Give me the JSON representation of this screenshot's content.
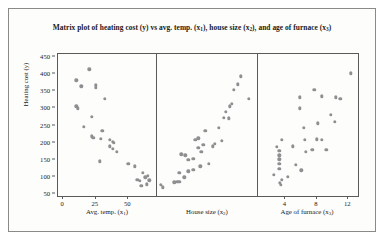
{
  "chart_data": {
    "type": "scatter",
    "title": "Matrix plot of heating cost (y) vs avg. temp. (x1), house size (x2), and age of furnace (x3)",
    "title_parts": {
      "seg1": "Matrix plot of heating cost (y) vs avg. temp. (x",
      "sub1": "1",
      "seg2": "), house size (x",
      "sub2": "2",
      "seg3": "), and age of furnace (x",
      "sub3": "3",
      "seg4": ")"
    },
    "ylabel": "Heating cost (y)",
    "ylabel_parts": {
      "text": "Heating cost (y)"
    },
    "ylim": [
      40,
      460
    ],
    "yticks": [
      50,
      100,
      150,
      200,
      250,
      300,
      350,
      400,
      450
    ],
    "grid": false,
    "legend": "none",
    "marker_color": "#8f8f91",
    "axis_color": "#5a5a5a",
    "panels": [
      {
        "name": "avg-temp",
        "xlabel_text": "Avg. temp. (x",
        "xlabel_sub": "1",
        "xlabel_tail": ")",
        "xlim": [
          -4,
          72
        ],
        "xticks": [
          0,
          25,
          50
        ],
        "xtick_labels": [
          "0",
          "25",
          "50"
        ],
        "relationship": "negative",
        "points": [
          {
            "x": 10,
            "y": 380
          },
          {
            "x": 14,
            "y": 362
          },
          {
            "x": 20,
            "y": 412
          },
          {
            "x": 10,
            "y": 303
          },
          {
            "x": 11,
            "y": 297
          },
          {
            "x": 25,
            "y": 365
          },
          {
            "x": 25,
            "y": 357
          },
          {
            "x": 22,
            "y": 272
          },
          {
            "x": 32,
            "y": 325
          },
          {
            "x": 16,
            "y": 243
          },
          {
            "x": 30,
            "y": 232
          },
          {
            "x": 22,
            "y": 215
          },
          {
            "x": 23,
            "y": 211
          },
          {
            "x": 29,
            "y": 208
          },
          {
            "x": 36,
            "y": 205
          },
          {
            "x": 38,
            "y": 200
          },
          {
            "x": 39,
            "y": 196
          },
          {
            "x": 36,
            "y": 186
          },
          {
            "x": 38,
            "y": 178
          },
          {
            "x": 41,
            "y": 170
          },
          {
            "x": 28,
            "y": 142
          },
          {
            "x": 50,
            "y": 134
          },
          {
            "x": 55,
            "y": 127
          },
          {
            "x": 61,
            "y": 108
          },
          {
            "x": 57,
            "y": 88
          },
          {
            "x": 59,
            "y": 84
          },
          {
            "x": 63,
            "y": 95
          },
          {
            "x": 65,
            "y": 100
          },
          {
            "x": 66,
            "y": 86
          },
          {
            "x": 60,
            "y": 70
          },
          {
            "x": 64,
            "y": 74
          }
        ]
      },
      {
        "name": "house-size",
        "xlabel_text": "House size (x",
        "xlabel_sub": "2",
        "xlabel_tail": ")",
        "xlim": [
          0,
          100
        ],
        "xticks": [],
        "xtick_labels": [],
        "relationship": "positive",
        "points": [
          {
            "x": 4,
            "y": 72
          },
          {
            "x": 6,
            "y": 66
          },
          {
            "x": 17,
            "y": 80
          },
          {
            "x": 20,
            "y": 82
          },
          {
            "x": 22,
            "y": 81
          },
          {
            "x": 27,
            "y": 95
          },
          {
            "x": 22,
            "y": 108
          },
          {
            "x": 31,
            "y": 113
          },
          {
            "x": 36,
            "y": 117
          },
          {
            "x": 43,
            "y": 127
          },
          {
            "x": 31,
            "y": 146
          },
          {
            "x": 36,
            "y": 149
          },
          {
            "x": 24,
            "y": 163
          },
          {
            "x": 28,
            "y": 160
          },
          {
            "x": 44,
            "y": 169
          },
          {
            "x": 51,
            "y": 135
          },
          {
            "x": 41,
            "y": 181
          },
          {
            "x": 46,
            "y": 190
          },
          {
            "x": 55,
            "y": 186
          },
          {
            "x": 57,
            "y": 193
          },
          {
            "x": 38,
            "y": 205
          },
          {
            "x": 41,
            "y": 210
          },
          {
            "x": 64,
            "y": 203
          },
          {
            "x": 48,
            "y": 232
          },
          {
            "x": 61,
            "y": 240
          },
          {
            "x": 66,
            "y": 270
          },
          {
            "x": 71,
            "y": 268
          },
          {
            "x": 68,
            "y": 288
          },
          {
            "x": 72,
            "y": 303
          },
          {
            "x": 74,
            "y": 310
          },
          {
            "x": 76,
            "y": 352
          },
          {
            "x": 80,
            "y": 368
          },
          {
            "x": 83,
            "y": 392
          },
          {
            "x": 91,
            "y": 325
          }
        ]
      },
      {
        "name": "age-of-furnace",
        "xlabel_text": "Age of furnace (x",
        "xlabel_sub": "3",
        "xlabel_tail": ")",
        "xlim": [
          0.5,
          13.5
        ],
        "xticks": [
          4,
          8,
          12
        ],
        "xtick_labels": [
          "4",
          "8",
          "12"
        ],
        "relationship": "weak positive",
        "points": [
          {
            "x": 3.3,
            "y": 78
          },
          {
            "x": 3.4,
            "y": 72
          },
          {
            "x": 3.5,
            "y": 88
          },
          {
            "x": 2.5,
            "y": 102
          },
          {
            "x": 4.3,
            "y": 96
          },
          {
            "x": 3.2,
            "y": 120
          },
          {
            "x": 3.2,
            "y": 134
          },
          {
            "x": 3.2,
            "y": 148
          },
          {
            "x": 3.2,
            "y": 160
          },
          {
            "x": 3.2,
            "y": 172
          },
          {
            "x": 2.9,
            "y": 185
          },
          {
            "x": 5.3,
            "y": 131
          },
          {
            "x": 6.0,
            "y": 115
          },
          {
            "x": 4.9,
            "y": 186
          },
          {
            "x": 6.6,
            "y": 170
          },
          {
            "x": 3.5,
            "y": 205
          },
          {
            "x": 6.5,
            "y": 205
          },
          {
            "x": 6.3,
            "y": 240
          },
          {
            "x": 7.4,
            "y": 175
          },
          {
            "x": 8.0,
            "y": 207
          },
          {
            "x": 8.6,
            "y": 205
          },
          {
            "x": 9.2,
            "y": 175
          },
          {
            "x": 8.1,
            "y": 253
          },
          {
            "x": 5.8,
            "y": 297
          },
          {
            "x": 5.8,
            "y": 330
          },
          {
            "x": 7.7,
            "y": 352
          },
          {
            "x": 8.6,
            "y": 333
          },
          {
            "x": 9.8,
            "y": 278
          },
          {
            "x": 10.3,
            "y": 258
          },
          {
            "x": 10.4,
            "y": 330
          },
          {
            "x": 11.0,
            "y": 325
          },
          {
            "x": 12.3,
            "y": 400
          }
        ]
      }
    ]
  }
}
